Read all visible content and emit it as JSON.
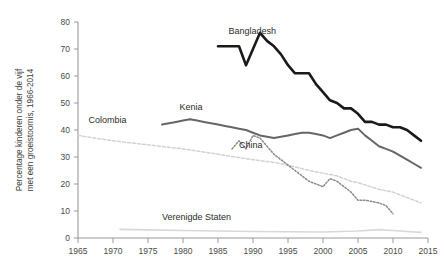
{
  "chart_data": {
    "type": "line",
    "title": "",
    "xlabel": "",
    "ylabel": "Percentage kinderen onder de vijf met een groeistoornis, 1966-2014",
    "ylabel_line1": "Percentage kinderen onder de vijf",
    "ylabel_line2": "met een groeistoornis, 1966-2014",
    "xlim": [
      1965,
      2015
    ],
    "ylim": [
      0,
      80
    ],
    "grid": false,
    "legend_position": "inline-labels",
    "xticks": [
      1965,
      1970,
      1975,
      1980,
      1985,
      1990,
      1995,
      2000,
      2005,
      2010,
      2015
    ],
    "xtick_labels": [
      "1965",
      "1970",
      "1975",
      "1980",
      "1985",
      "1990",
      "1995",
      "2000",
      "2005",
      "2010",
      "2015"
    ],
    "yticks": [
      0,
      10,
      20,
      30,
      40,
      50,
      60,
      70,
      80
    ],
    "ytick_labels": [
      "0",
      "10",
      "20",
      "30",
      "40",
      "50",
      "60",
      "70",
      "80"
    ],
    "series": [
      {
        "name": "Bangladesh",
        "label": "Bangladesh",
        "color": "#1a1a1a",
        "width": 2.6,
        "dash": "none",
        "label_x": 1986.5,
        "label_y": 75.5,
        "x": [
          1985,
          1986,
          1987,
          1988,
          1989,
          1990,
          1991,
          1992,
          1993,
          1994,
          1995,
          1996,
          1997,
          1998,
          1999,
          2000,
          2001,
          2002,
          2003,
          2004,
          2005,
          2006,
          2007,
          2008,
          2009,
          2010,
          2011,
          2012,
          2013,
          2014
        ],
        "y": [
          71,
          71,
          71,
          71,
          64,
          70,
          76,
          73,
          71,
          68,
          64,
          61,
          61,
          61,
          57,
          54,
          51,
          50,
          48,
          48,
          46,
          43,
          43,
          42,
          42,
          41,
          41,
          40,
          38,
          36
        ]
      },
      {
        "name": "Kenia",
        "label": "Kenia",
        "color": "#666666",
        "width": 2.0,
        "dash": "none",
        "label_x": 1979.5,
        "label_y": 47.5,
        "x": [
          1977,
          1978,
          1979,
          1980,
          1981,
          1982,
          1983,
          1984,
          1985,
          1986,
          1987,
          1988,
          1989,
          1990,
          1991,
          1992,
          1993,
          1994,
          1995,
          1996,
          1997,
          1998,
          1999,
          2000,
          2001,
          2002,
          2003,
          2004,
          2005,
          2006,
          2007,
          2008,
          2009,
          2010,
          2011,
          2012,
          2013,
          2014
        ],
        "y": [
          42,
          42.5,
          43,
          43.5,
          44,
          43.5,
          43,
          42.5,
          42,
          41.5,
          41,
          40.5,
          40,
          39,
          38,
          37.5,
          37,
          37.5,
          38,
          38.5,
          39,
          39,
          38.5,
          38,
          37,
          38,
          39,
          40,
          40.5,
          38,
          36,
          34,
          33,
          32,
          30.5,
          29,
          27.5,
          26
        ]
      },
      {
        "name": "China",
        "label": "China",
        "color": "#8a8a8a",
        "width": 1.5,
        "dash": "1.6 1.8",
        "label_x": 1988,
        "label_y": 33.5,
        "x": [
          1987,
          1988,
          1989,
          1990,
          1991,
          1992,
          1993,
          1994,
          1995,
          1996,
          1997,
          1998,
          1999,
          2000,
          2001,
          2002,
          2003,
          2004,
          2005,
          2006,
          2007,
          2008,
          2009,
          2010
        ],
        "y": [
          33,
          36,
          33,
          38,
          37,
          34,
          31,
          29,
          27,
          25,
          23,
          21,
          20,
          19,
          22,
          21,
          19,
          17,
          14,
          14,
          13.5,
          13,
          12,
          9
        ]
      },
      {
        "name": "Colombia",
        "label": "Colombia",
        "color": "#d2d2d2",
        "width": 1.5,
        "dash": "3 2",
        "label_x": 1966.5,
        "label_y": 42.5,
        "x": [
          1965,
          1970,
          1975,
          1980,
          1985,
          1990,
          1993,
          1995,
          1998,
          2000,
          2002,
          2004,
          2005,
          2008,
          2010,
          2012,
          2014
        ],
        "y": [
          38,
          36,
          34.5,
          33,
          31,
          29,
          28,
          27,
          25,
          24,
          23,
          21,
          20.5,
          18,
          17,
          15,
          13
        ]
      },
      {
        "name": "Verenigde Staten",
        "label": "Verenigde Staten",
        "color": "#d8d8d8",
        "width": 1.6,
        "dash": "none",
        "label_x": 1977,
        "label_y": 6.5,
        "x": [
          1971,
          1975,
          1980,
          1985,
          1990,
          1995,
          2000,
          2005,
          2008,
          2010,
          2012,
          2014
        ],
        "y": [
          3.2,
          3.0,
          2.8,
          2.6,
          2.4,
          2.3,
          2.2,
          2.6,
          3.1,
          2.8,
          2.4,
          2.1
        ]
      }
    ]
  }
}
